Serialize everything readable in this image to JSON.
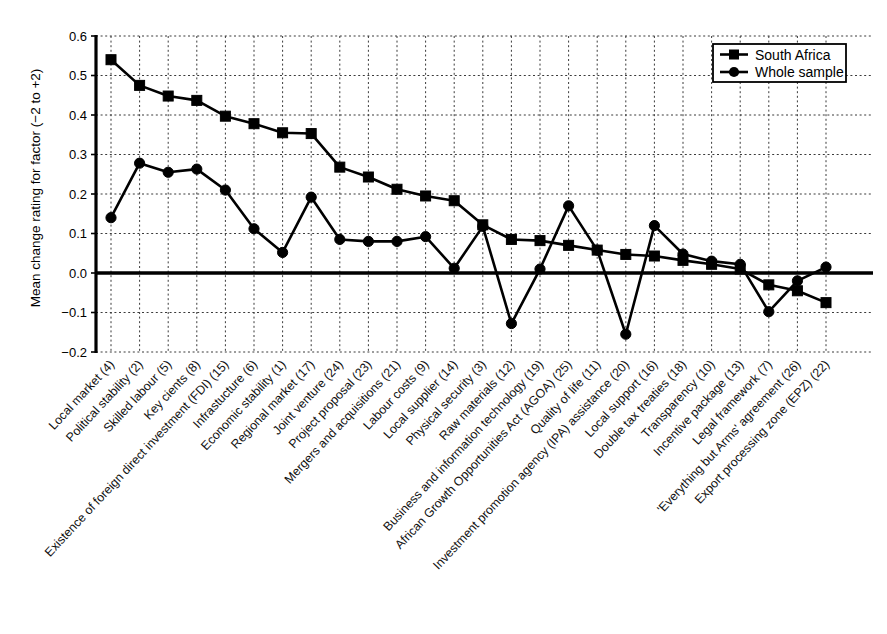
{
  "chart_data": {
    "type": "line",
    "title": "",
    "xlabel": "",
    "ylabel": "Mean change rating for factor (−2 to +2)",
    "ylim": [
      -0.2,
      0.6
    ],
    "ytick_labels": [
      "0.6",
      "0.5",
      "0.4",
      "0.3",
      "0.2",
      "0.1",
      "0.0",
      "−0.1",
      "−0.2"
    ],
    "ytick_values": [
      0.6,
      0.5,
      0.4,
      0.3,
      0.2,
      0.1,
      0.0,
      -0.1,
      -0.2
    ],
    "grid": true,
    "legend_position": "top-right",
    "zero_line": true,
    "categories": [
      "Local market (4)",
      "Political stability (2)",
      "Skilled labour (5)",
      "Key cients (8)",
      "Existence of foreign direct investment (FDI) (15)",
      "Infrastucture (6)",
      "Economic stability (1)",
      "Regional market (17)",
      "Joint venture (24)",
      "Project proposal (23)",
      "Mergers and acquisitions (21)",
      "Labour costs (9)",
      "Local supplier (14)",
      "Physical security (3)",
      "Raw materials (12)",
      "Business and information technology (19)",
      "African Growth Opportunities Act (AGOA) (25)",
      "Quality of life (11)",
      "Investment promotion agency (IPA) assistance (20)",
      "Local support (16)",
      "Double tax treaties (18)",
      "Transparency (10)",
      "Incentive package (13)",
      "Legal framework (7)",
      "'Everything but Arms' agreement (26)",
      "Export processing zone (EPZ) (22)"
    ],
    "series": [
      {
        "name": "South Africa",
        "marker": "square",
        "color": "#000000",
        "values": [
          0.54,
          0.475,
          0.448,
          0.437,
          0.397,
          0.378,
          0.355,
          0.353,
          0.268,
          0.243,
          0.212,
          0.195,
          0.183,
          0.122,
          0.085,
          0.082,
          0.07,
          0.058,
          0.047,
          0.043,
          0.032,
          0.022,
          0.01,
          -0.03,
          -0.045,
          -0.075
        ]
      },
      {
        "name": "Whole sample",
        "marker": "circle",
        "color": "#000000",
        "values": [
          0.14,
          0.278,
          0.255,
          0.263,
          0.21,
          0.112,
          0.052,
          0.192,
          0.085,
          0.08,
          0.08,
          0.092,
          0.012,
          0.118,
          -0.128,
          0.01,
          0.17,
          0.058,
          -0.155,
          0.12,
          0.048,
          0.03,
          0.022,
          -0.098,
          -0.02,
          0.015
        ]
      }
    ]
  },
  "legend": {
    "entries": [
      {
        "label": "South Africa",
        "marker": "square"
      },
      {
        "label": "Whole sample",
        "marker": "circle"
      }
    ]
  },
  "axis": {
    "y_title": "Mean change rating for factor (−2 to +2)"
  }
}
